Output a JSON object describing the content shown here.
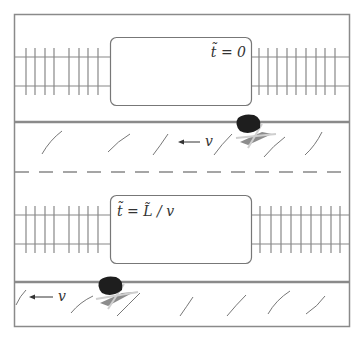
{
  "figure": {
    "colors": {
      "frame": "#8a8a8a",
      "road_line": "#8a8a8a",
      "track": "#888888",
      "car_body": "#1e1e1e",
      "car_shadow": "#8c8c8c",
      "text": "#333333"
    }
  },
  "panels": [
    {
      "id": "top",
      "time_label": "t̃ = 0",
      "velocity_label": "← v"
    },
    {
      "id": "bottom",
      "time_label": "t̃ = L̃ / v",
      "velocity_label": "← v"
    }
  ]
}
